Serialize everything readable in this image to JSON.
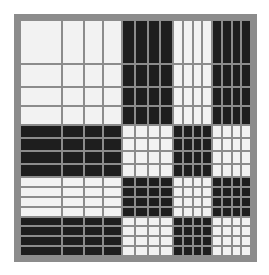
{
  "figure": {
    "title": "Walsh–Hadamard basis mosaic"
  },
  "layout": {
    "frame": {
      "x": 14,
      "y": 14,
      "width": 243,
      "height": 248,
      "border": 7
    },
    "gap": 2,
    "column_groups": [
      {
        "count": 1,
        "size": 26
      },
      {
        "count": 1,
        "size": 13
      },
      {
        "count": 2,
        "size": 11
      },
      {
        "count": 4,
        "size": 7
      },
      {
        "count": 8,
        "size": 5
      }
    ],
    "row_groups": [
      {
        "count": 1,
        "size": 27
      },
      {
        "count": 1,
        "size": 13
      },
      {
        "count": 2,
        "size": 11
      },
      {
        "count": 4,
        "size": 7
      },
      {
        "count": 8,
        "size": 5
      }
    ]
  },
  "colors": {
    "background": "#ffffff",
    "grid_gray": "#8c8c8c",
    "positive": "#f2f2f2",
    "negative": "#1e1e1e"
  }
}
